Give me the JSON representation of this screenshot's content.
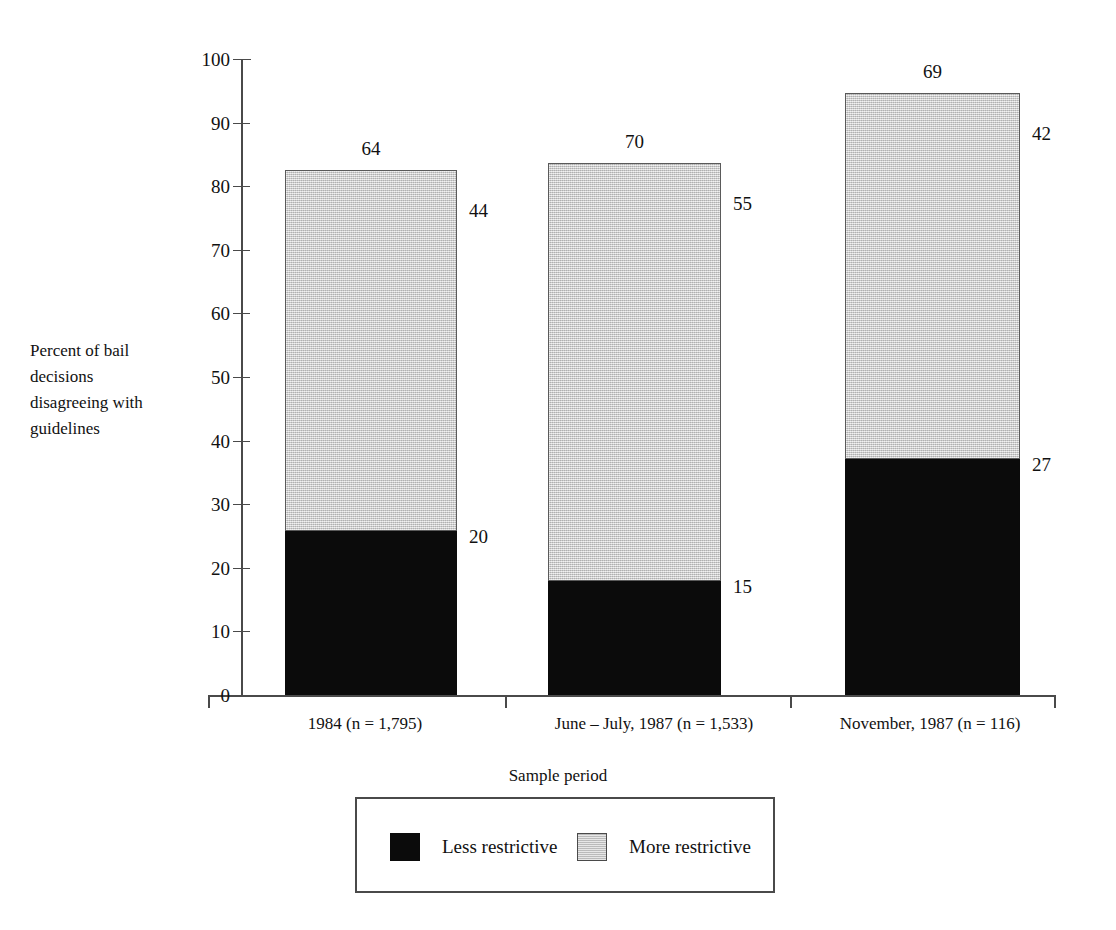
{
  "chart_data": {
    "type": "bar",
    "subtype": "stacked-vertical",
    "title": "",
    "xlabel": "Sample period",
    "ylabel": "Percent of bail decisions disagreeing with guidelines",
    "ylim": [
      0,
      100
    ],
    "ytick_labels": [
      "0",
      "10",
      "20",
      "30",
      "40",
      "50",
      "60",
      "70",
      "80",
      "90",
      "100"
    ],
    "ytick_values": [
      0,
      10,
      20,
      30,
      40,
      50,
      60,
      70,
      80,
      90,
      100
    ],
    "grid": false,
    "legend_position": "bottom",
    "categories": [
      "1984 (n = 1,795)",
      "June – July, 1987 (n = 1,533)",
      "November, 1987 (n = 116)"
    ],
    "series": [
      {
        "name": "Less restrictive",
        "color": "#0b0b0b",
        "values": [
          20,
          15,
          27
        ]
      },
      {
        "name": "More restrictive",
        "color": "#c9c9c9",
        "values": [
          44,
          55,
          42
        ]
      }
    ],
    "totals": [
      64,
      70,
      69
    ],
    "bar_top_positions_percent": [
      82.5,
      83.7,
      94.7
    ],
    "annotations": {
      "bar_totals": [
        "64",
        "70",
        "69"
      ],
      "less_restrictive_labels": [
        "20",
        "15",
        "27"
      ],
      "more_restrictive_labels": [
        "44",
        "55",
        "42"
      ]
    }
  },
  "axis": {
    "y_title_lines": [
      "Percent of bail",
      "decisions",
      "disagreeing with",
      "guidelines"
    ],
    "x_title": "Sample period"
  },
  "legend": {
    "entries": [
      {
        "label": "Less restrictive",
        "swatch": "black-square-swatch"
      },
      {
        "label": "More restrictive",
        "swatch": "gray-square-swatch"
      }
    ]
  }
}
